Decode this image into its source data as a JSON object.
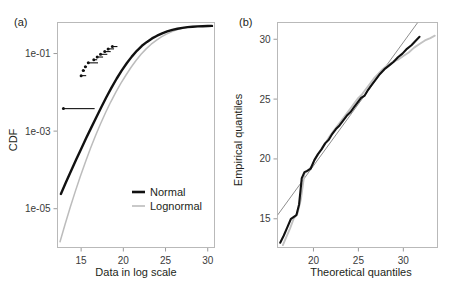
{
  "figure": {
    "background": "#ffffff",
    "panels": [
      {
        "label": "(a)",
        "xlabel": "Data in log scale",
        "ylabel": "CDF"
      },
      {
        "label": "(b)",
        "xlabel": "Theoretical quantiles",
        "ylabel": "Empirical quantiles"
      }
    ]
  },
  "colors": {
    "normal": "#111111",
    "lognormal": "#bcbcbc",
    "reference": "#8e8e8e",
    "frame": "#b9b9b9",
    "text": "#231f20"
  },
  "legend": {
    "position": "bottom-right",
    "entries": [
      {
        "label": "Normal",
        "color": "#111111",
        "width": 2.6
      },
      {
        "label": "Lognormal",
        "color": "#bcbcbc",
        "width": 1.6
      }
    ]
  },
  "chart_data": [
    {
      "id": "panel-a",
      "type": "line",
      "title": "(a)",
      "xlabel": "Data in log scale",
      "ylabel": "CDF",
      "xlim": [
        12.2,
        30.8
      ],
      "ylim_log10": [
        -6.0,
        -0.2
      ],
      "xticks": [
        15,
        20,
        25,
        30
      ],
      "xtick_labels": [
        "15",
        "20",
        "25",
        "30"
      ],
      "yticks_log10": [
        -1,
        -3,
        -5
      ],
      "ytick_labels": [
        "1e-01",
        "1e-03",
        "1e-05"
      ],
      "grid": false,
      "yscale": "log",
      "series": [
        {
          "name": "Normal",
          "color": "#111111",
          "points_x": [
            12.6,
            13.2,
            13.8,
            14.4,
            15.0,
            15.6,
            16.2,
            16.8,
            17.4,
            18.0,
            18.6,
            19.2,
            19.8,
            20.4,
            21.0,
            21.6,
            22.2,
            22.8,
            23.4,
            24.0,
            24.6,
            25.2,
            25.8,
            26.4,
            27.0,
            27.6,
            28.2,
            28.8,
            29.4,
            30.0,
            30.5
          ],
          "points_log10y": [
            -4.62,
            -4.32,
            -4.03,
            -3.74,
            -3.46,
            -3.18,
            -2.91,
            -2.64,
            -2.38,
            -2.12,
            -1.88,
            -1.65,
            -1.44,
            -1.25,
            -1.08,
            -0.93,
            -0.8,
            -0.7,
            -0.61,
            -0.54,
            -0.48,
            -0.43,
            -0.39,
            -0.36,
            -0.34,
            -0.32,
            -0.31,
            -0.3,
            -0.295,
            -0.29,
            -0.288
          ]
        },
        {
          "name": "Lognormal",
          "color": "#bcbcbc",
          "points_x": [
            12.5,
            13.1,
            13.7,
            14.3,
            14.9,
            15.5,
            16.1,
            16.7,
            17.3,
            17.9,
            18.5,
            19.1,
            19.7,
            20.3,
            20.9,
            21.5,
            22.1,
            22.7,
            23.3,
            23.9,
            24.5,
            25.1,
            25.7,
            26.3,
            26.9,
            27.5,
            28.1,
            28.7,
            29.3,
            29.9,
            30.5
          ],
          "points_log10y": [
            -5.85,
            -5.4,
            -4.97,
            -4.56,
            -4.17,
            -3.8,
            -3.45,
            -3.12,
            -2.81,
            -2.52,
            -2.25,
            -2.0,
            -1.77,
            -1.56,
            -1.36,
            -1.18,
            -1.02,
            -0.88,
            -0.76,
            -0.66,
            -0.57,
            -0.5,
            -0.44,
            -0.39,
            -0.355,
            -0.33,
            -0.312,
            -0.3,
            -0.293,
            -0.289,
            -0.287
          ]
        },
        {
          "name": "Empirical CDF steps",
          "color": "#111111",
          "style": "step-markers",
          "steps": [
            {
              "x_start": 12.9,
              "x_end": 16.6,
              "log10y": -2.42
            },
            {
              "x_start": 15.0,
              "x_end": 15.6,
              "log10y": -1.57
            },
            {
              "x_start": 15.25,
              "x_end": 15.45,
              "log10y": -1.44
            },
            {
              "x_start": 15.5,
              "x_end": 15.7,
              "log10y": -1.34
            },
            {
              "x_start": 15.85,
              "x_end": 17.0,
              "log10y": -1.24
            },
            {
              "x_start": 16.5,
              "x_end": 16.9,
              "log10y": -1.16
            },
            {
              "x_start": 16.9,
              "x_end": 17.6,
              "log10y": -1.09
            },
            {
              "x_start": 17.3,
              "x_end": 18.1,
              "log10y": -1.02
            },
            {
              "x_start": 17.8,
              "x_end": 18.5,
              "log10y": -0.95
            },
            {
              "x_start": 18.2,
              "x_end": 18.9,
              "log10y": -0.88
            },
            {
              "x_start": 18.7,
              "x_end": 19.3,
              "log10y": -0.82
            }
          ]
        }
      ]
    },
    {
      "id": "panel-b",
      "type": "line",
      "title": "(b)",
      "xlabel": "Theoretical quantiles",
      "ylabel": "Empirical quantiles",
      "xlim": [
        16.0,
        33.8
      ],
      "ylim": [
        12.6,
        31.4
      ],
      "xticks": [
        20,
        25,
        30
      ],
      "xtick_labels": [
        "20",
        "25",
        "30"
      ],
      "yticks": [
        15,
        20,
        25,
        30
      ],
      "ytick_labels": [
        "15",
        "20",
        "25",
        "30"
      ],
      "grid": false,
      "series": [
        {
          "name": "Reference line",
          "color": "#8e8e8e",
          "style": "straight",
          "x": [
            16.0,
            31.6
          ],
          "y": [
            15.3,
            31.4
          ]
        },
        {
          "name": "Normal Q-Q",
          "color": "#111111",
          "x": [
            16.3,
            16.7,
            17.1,
            17.5,
            17.9,
            18.1,
            18.4,
            18.7,
            19.0,
            19.3,
            19.7,
            20.1,
            20.5,
            20.9,
            21.3,
            21.7,
            22.1,
            22.5,
            22.9,
            23.3,
            23.7,
            24.1,
            24.5,
            24.9,
            25.3,
            25.7,
            26.1,
            26.5,
            26.9,
            27.4,
            27.9,
            28.4,
            28.9,
            29.4,
            29.9,
            30.4,
            30.9,
            31.4,
            31.8
          ],
          "y": [
            13.0,
            13.6,
            14.3,
            15.0,
            15.2,
            15.3,
            16.2,
            18.4,
            18.9,
            19.0,
            19.2,
            19.9,
            20.4,
            20.8,
            21.3,
            21.6,
            22.1,
            22.5,
            22.8,
            23.2,
            23.6,
            23.9,
            24.3,
            24.7,
            25.1,
            25.3,
            25.8,
            26.2,
            26.6,
            27.1,
            27.5,
            27.8,
            28.1,
            28.5,
            28.8,
            29.2,
            29.5,
            29.9,
            30.2
          ]
        },
        {
          "name": "Lognormal Q-Q",
          "color": "#c2c2c2",
          "x": [
            16.6,
            17.0,
            17.4,
            17.8,
            18.2,
            18.6,
            19.0,
            19.4,
            19.8,
            20.2,
            20.6,
            21.0,
            21.4,
            21.8,
            22.2,
            22.6,
            23.0,
            23.4,
            23.8,
            24.2,
            24.6,
            25.0,
            25.4,
            25.8,
            26.2,
            26.7,
            27.2,
            27.7,
            28.2,
            28.8,
            29.4,
            30.0,
            30.6,
            31.2,
            31.8,
            32.4,
            33.0,
            33.5
          ],
          "y": [
            12.8,
            13.5,
            14.2,
            15.0,
            15.4,
            16.6,
            18.8,
            19.0,
            19.4,
            20.0,
            20.5,
            21.0,
            21.4,
            21.9,
            22.3,
            22.7,
            23.1,
            23.5,
            23.9,
            24.3,
            24.7,
            25.1,
            25.4,
            25.8,
            26.2,
            26.7,
            27.1,
            27.5,
            27.8,
            28.1,
            28.3,
            28.6,
            28.9,
            29.3,
            29.6,
            29.9,
            30.1,
            30.3
          ]
        }
      ]
    }
  ]
}
